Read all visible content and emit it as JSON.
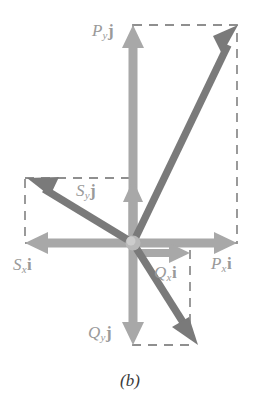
{
  "figure": {
    "caption": "(b)",
    "colors": {
      "component_arrow": "#a8a8a8",
      "resultant_arrow": "#7a7a7a",
      "dashed_guide": "#8f8f8f",
      "label_text": "#9a9a9a",
      "origin_dot": "#b5b5b5",
      "background": "#ffffff"
    },
    "origin": {
      "x": 133,
      "y": 243
    },
    "labels": {
      "py_j": {
        "symbol": "P",
        "subscript": "y",
        "unit": "j",
        "text": "P_y j"
      },
      "px_i": {
        "symbol": "P",
        "subscript": "x",
        "unit": "i",
        "text": "P_x i"
      },
      "sy_j": {
        "symbol": "S",
        "subscript": "y",
        "unit": "j",
        "text": "S_y j"
      },
      "sx_i": {
        "symbol": "S",
        "subscript": "x",
        "unit": "i",
        "text": "S_x i"
      },
      "qy_j": {
        "symbol": "Q",
        "subscript": "y",
        "unit": "j",
        "text": "Q_y j"
      },
      "qx_i": {
        "symbol": "Q",
        "subscript": "x",
        "unit": "i",
        "text": "Q_x i"
      }
    },
    "vectors": [
      {
        "name": "P",
        "kind": "resultant",
        "from": {
          "x": 133,
          "y": 243
        },
        "to": {
          "x": 238,
          "y": 25
        },
        "components": [
          {
            "name": "Px",
            "axis": "x",
            "from": {
              "x": 133,
              "y": 243
            },
            "to": {
              "x": 237,
              "y": 243
            }
          },
          {
            "name": "Py",
            "axis": "y",
            "from": {
              "x": 133,
              "y": 243
            },
            "to": {
              "x": 133,
              "y": 25
            }
          }
        ],
        "guide_rect": {
          "x": 133,
          "y": 25,
          "w": 104,
          "h": 218
        }
      },
      {
        "name": "S",
        "kind": "resultant",
        "from": {
          "x": 133,
          "y": 243
        },
        "to": {
          "x": 27,
          "y": 178
        },
        "components": [
          {
            "name": "Sx",
            "axis": "x",
            "from": {
              "x": 133,
              "y": 243
            },
            "to": {
              "x": 25,
              "y": 243
            }
          },
          {
            "name": "Sy",
            "axis": "y",
            "from": {
              "x": 133,
              "y": 243
            },
            "to": {
              "x": 133,
              "y": 180
            }
          }
        ],
        "guide_rect": {
          "x": 25,
          "y": 178,
          "w": 108,
          "h": 65
        }
      },
      {
        "name": "Q",
        "kind": "resultant",
        "from": {
          "x": 133,
          "y": 243
        },
        "to": {
          "x": 198,
          "y": 345
        },
        "components": [
          {
            "name": "Qx",
            "axis": "x",
            "from": {
              "x": 133,
              "y": 243
            },
            "to": {
              "x": 190,
              "y": 243
            }
          },
          {
            "name": "Qy",
            "axis": "y",
            "from": {
              "x": 133,
              "y": 243
            },
            "to": {
              "x": 133,
              "y": 345
            }
          }
        ],
        "guide_rect": {
          "x": 133,
          "y": 243,
          "w": 57,
          "h": 102
        }
      }
    ]
  }
}
